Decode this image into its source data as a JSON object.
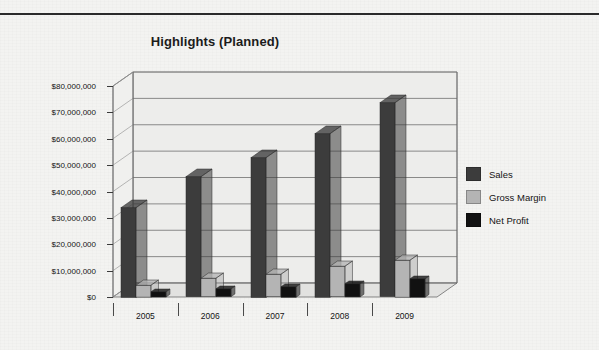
{
  "document": {
    "top_rule": true
  },
  "chart_data": {
    "type": "bar",
    "title": "Highlights (Planned)",
    "xlabel": "",
    "ylabel": "",
    "categories": [
      "2005",
      "2006",
      "2007",
      "2008",
      "2009"
    ],
    "series": [
      {
        "name": "Sales",
        "color": "#3c3c3c",
        "values": [
          34000000,
          45500000,
          53000000,
          62000000,
          73500000
        ]
      },
      {
        "name": "Gross Margin",
        "color": "#b4b4b4",
        "values": [
          4500000,
          7000000,
          8500000,
          11500000,
          14000000
        ]
      },
      {
        "name": "Net Profit",
        "color": "#111111",
        "values": [
          2000000,
          3000000,
          4000000,
          5000000,
          7000000
        ]
      }
    ],
    "ylim": [
      0,
      80000000
    ],
    "ytick_values": [
      0,
      10000000,
      20000000,
      30000000,
      40000000,
      50000000,
      60000000,
      70000000,
      80000000
    ],
    "ytick_labels": [
      "$0",
      "$10,000,000",
      "$20,000,000",
      "$30,000,000",
      "$40,000,000",
      "$50,000,000",
      "$60,000,000",
      "$70,000,000",
      "$80,000,000"
    ],
    "grid": true,
    "legend_position": "right",
    "style": "3d-column",
    "plot_background": "#ededeb",
    "gridline_color": "#6e6e6e"
  },
  "legend": {
    "entries": [
      {
        "label": "Sales",
        "color": "#3c3c3c"
      },
      {
        "label": "Gross Margin",
        "color": "#b4b4b4"
      },
      {
        "label": "Net Profit",
        "color": "#111111"
      }
    ]
  }
}
